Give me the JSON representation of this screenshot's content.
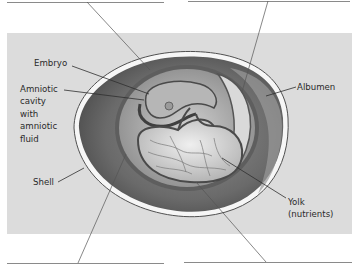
{
  "diagram": {
    "labels": {
      "embryo": "Embryo",
      "amniotic_cavity": "Amniotic\ncavity\nwith\namniotic\nfluid",
      "shell": "Shell",
      "albumen": "Albumen",
      "yolk": "Yolk\n(nutrients)"
    },
    "blank_labels": [
      {
        "position": "top-left",
        "text": ""
      },
      {
        "position": "top-right",
        "text": ""
      },
      {
        "position": "bottom-left",
        "text": ""
      },
      {
        "position": "bottom-right",
        "text": ""
      }
    ],
    "colors": {
      "panel": "#dcdcdc",
      "leader": "#3a3a3a",
      "shell": "#f4f4f4",
      "outer_membrane": "#5f5f5f",
      "yolk": "#c9c9c9"
    }
  }
}
